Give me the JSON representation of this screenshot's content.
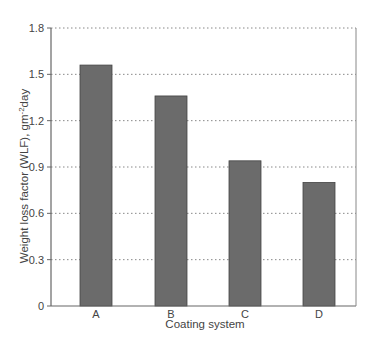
{
  "chart_data": {
    "type": "bar",
    "title": "",
    "xlabel": "Coating system",
    "ylabel": "Weight loss factor (WLF), gm",
    "ylabel_sup": "-2",
    "ylabel_suffix": "day",
    "categories": [
      "A",
      "B",
      "C",
      "D"
    ],
    "values": [
      1.56,
      1.36,
      0.94,
      0.8
    ],
    "ylim": [
      0,
      1.8
    ],
    "yticks": [
      0,
      0.3,
      0.6,
      0.9,
      1.2,
      1.5,
      1.8
    ],
    "ytick_labels": [
      "0",
      "0.3",
      "0.6",
      "0.9",
      "1.2",
      "1.5",
      "1.8"
    ],
    "grid": "horizontal dotted",
    "legend": null,
    "bar_color": "#6b6b6b"
  }
}
